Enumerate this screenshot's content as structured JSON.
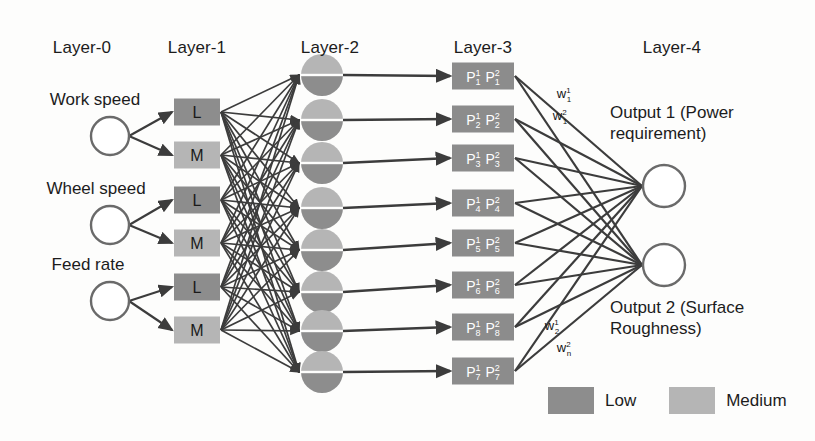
{
  "colors": {
    "low_fill": "#8d8d8d",
    "medium_fill": "#b5b5b5",
    "node_stroke": "#6a6a6a",
    "edge": "#3c3c3c",
    "text": "#1c1c1c",
    "box_text": "#ffffff",
    "background": "#fdfdfc"
  },
  "layer_headers": [
    {
      "label": "Layer-0",
      "x": 82,
      "y": 38
    },
    {
      "label": "Layer-1",
      "x": 197,
      "y": 38
    },
    {
      "label": "Layer-2",
      "x": 330,
      "y": 38
    },
    {
      "label": "Layer-3",
      "x": 483,
      "y": 38
    },
    {
      "label": "Layer-4",
      "x": 672,
      "y": 38
    }
  ],
  "layer0": {
    "name": "input-layer",
    "nodes": [
      {
        "label": "Work speed",
        "cx": 110,
        "cy": 136,
        "r": 19,
        "label_x": 95,
        "label_y": 90
      },
      {
        "label": "Wheel speed",
        "cx": 110,
        "cy": 225,
        "r": 19,
        "label_x": 96,
        "label_y": 179
      },
      {
        "label": "Feed rate",
        "cx": 110,
        "cy": 301,
        "r": 19,
        "label_x": 88,
        "label_y": 255
      }
    ]
  },
  "layer1": {
    "name": "fuzzification-layer",
    "nodes": [
      {
        "label": "L",
        "grade": "low",
        "cx": 197,
        "cy": 112
      },
      {
        "label": "M",
        "grade": "medium",
        "cx": 197,
        "cy": 155
      },
      {
        "label": "L",
        "grade": "low",
        "cx": 197,
        "cy": 200
      },
      {
        "label": "M",
        "grade": "medium",
        "cx": 197,
        "cy": 243
      },
      {
        "label": "L",
        "grade": "low",
        "cx": 197,
        "cy": 287
      },
      {
        "label": "M",
        "grade": "medium",
        "cx": 197,
        "cy": 330
      }
    ]
  },
  "layer2": {
    "name": "rule-layer",
    "nodes": [
      {
        "cx": 322,
        "cy": 75,
        "r": 21
      },
      {
        "cx": 322,
        "cy": 120,
        "r": 21
      },
      {
        "cx": 322,
        "cy": 163,
        "r": 21
      },
      {
        "cx": 322,
        "cy": 208,
        "r": 21
      },
      {
        "cx": 322,
        "cy": 250,
        "r": 21
      },
      {
        "cx": 322,
        "cy": 292,
        "r": 21
      },
      {
        "cx": 322,
        "cy": 331,
        "r": 21
      },
      {
        "cx": 322,
        "cy": 372,
        "r": 21
      }
    ]
  },
  "layer3": {
    "name": "normalization-layer",
    "nodes": [
      {
        "p1": "P",
        "sup1": "1",
        "sub1": "1",
        "p2": "P",
        "sup2": "2",
        "sub2": "1",
        "cx": 483,
        "cy": 76
      },
      {
        "p1": "P",
        "sup1": "1",
        "sub1": "2",
        "p2": "P",
        "sup2": "2",
        "sub2": "2",
        "cx": 483,
        "cy": 119
      },
      {
        "p1": "P",
        "sup1": "1",
        "sub1": "3",
        "p2": "P",
        "sup2": "2",
        "sub2": "3",
        "cx": 483,
        "cy": 158
      },
      {
        "p1": "P",
        "sup1": "1",
        "sub1": "4",
        "p2": "P",
        "sup2": "2",
        "sub2": "4",
        "cx": 483,
        "cy": 203
      },
      {
        "p1": "P",
        "sup1": "1",
        "sub1": "5",
        "p2": "P",
        "sup2": "2",
        "sub2": "5",
        "cx": 483,
        "cy": 243
      },
      {
        "p1": "P",
        "sup1": "1",
        "sub1": "6",
        "p2": "P",
        "sup2": "2",
        "sub2": "6",
        "cx": 483,
        "cy": 285
      },
      {
        "p1": "P",
        "sup1": "1",
        "sub1": "8",
        "p2": "P",
        "sup2": "2",
        "sub2": "8",
        "cx": 483,
        "cy": 327
      },
      {
        "p1": "P",
        "sup1": "1",
        "sub1": "7",
        "p2": "P",
        "sup2": "2",
        "sub2": "7",
        "cx": 483,
        "cy": 371
      }
    ]
  },
  "layer4": {
    "name": "output-layer",
    "nodes": [
      {
        "cx": 664,
        "cy": 186,
        "r": 21,
        "label": "Output 1 (Power requirement)",
        "label_x": 610,
        "label_y": 103
      },
      {
        "cx": 664,
        "cy": 265,
        "r": 21,
        "label": "Output 2 (Surface Roughness)",
        "label_x": 610,
        "label_y": 298
      }
    ]
  },
  "weights": [
    {
      "base": "w",
      "sup": "1",
      "sub": "1",
      "x": 564,
      "y": 86
    },
    {
      "base": "w",
      "sup": "2",
      "sub": "1",
      "x": 560,
      "y": 108
    },
    {
      "base": "w",
      "sup": "1",
      "sub": "2",
      "x": 552,
      "y": 318
    },
    {
      "base": "w",
      "sup": "2",
      "sub": "n",
      "x": 564,
      "y": 340
    }
  ],
  "legend": {
    "x": 548,
    "y": 387,
    "items": [
      {
        "label": "Low",
        "grade": "low"
      },
      {
        "label": "Medium",
        "grade": "medium"
      }
    ]
  }
}
